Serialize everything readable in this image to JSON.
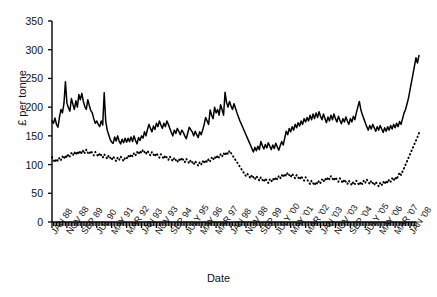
{
  "chart_data": {
    "type": "line",
    "title": "",
    "xlabel": "Date",
    "ylabel": "£ per tonne",
    "ylim": [
      0,
      350
    ],
    "ytick_values": [
      0,
      50,
      100,
      150,
      200,
      250,
      300,
      350
    ],
    "grid": false,
    "legend": null,
    "x_tick_labels": [
      "JAN 88",
      "NOV 88",
      "SEP 89",
      "JUL 90",
      "MAY 91",
      "MAR 92",
      "JAN 93",
      "NOV 93",
      "SEP 94",
      "JULY 95",
      "MAY 96",
      "MAR 97",
      "JAN 98",
      "NOV 98",
      "SEP 99",
      "JULY '00",
      "MAY '01",
      "MAR '02",
      "JAN '03",
      "NOV '03",
      "SEP '04",
      "JULY '05",
      "MAY '06",
      "MAR '07",
      "JAN '08"
    ],
    "x_index_of_labels": [
      0,
      10,
      20,
      30,
      40,
      50,
      60,
      70,
      80,
      90,
      100,
      110,
      120,
      130,
      140,
      150,
      160,
      170,
      180,
      190,
      200,
      210,
      220,
      230,
      240
    ],
    "n_points": 245,
    "series": [
      {
        "name": "solid-series",
        "style": "solid",
        "color": "#000000",
        "values": [
          176,
          172,
          181,
          170,
          165,
          182,
          196,
          190,
          206,
          244,
          207,
          199,
          193,
          215,
          205,
          196,
          211,
          200,
          222,
          213,
          224,
          210,
          201,
          196,
          213,
          203,
          194,
          190,
          180,
          172,
          176,
          170,
          166,
          176,
          169,
          225,
          176,
          160,
          152,
          144,
          139,
          137,
          148,
          141,
          150,
          141,
          136,
          144,
          138,
          146,
          139,
          146,
          140,
          148,
          140,
          150,
          142,
          136,
          147,
          142,
          150,
          146,
          157,
          150,
          161,
          170,
          163,
          157,
          167,
          161,
          172,
          166,
          176,
          169,
          163,
          172,
          166,
          176,
          170,
          163,
          156,
          150,
          160,
          154,
          163,
          158,
          152,
          160,
          156,
          150,
          145,
          155,
          165,
          161,
          157,
          150,
          158,
          152,
          147,
          157,
          152,
          160,
          170,
          182,
          176,
          170,
          195,
          186,
          180,
          200,
          190,
          196,
          186,
          204,
          196,
          186,
          226,
          208,
          200,
          210,
          202,
          196,
          206,
          198,
          190,
          183,
          176,
          170,
          164,
          158,
          152,
          146,
          140,
          134,
          128,
          122,
          130,
          124,
          132,
          126,
          140,
          133,
          127,
          135,
          129,
          138,
          132,
          126,
          134,
          128,
          137,
          131,
          125,
          133,
          140,
          134,
          146,
          158,
          152,
          163,
          157,
          166,
          160,
          170,
          164,
          173,
          167,
          176,
          170,
          180,
          174,
          182,
          176,
          186,
          178,
          188,
          180,
          190,
          182,
          192,
          184,
          178,
          188,
          180,
          173,
          183,
          176,
          186,
          178,
          188,
          180,
          174,
          184,
          177,
          171,
          180,
          174,
          183,
          176,
          170,
          180,
          174,
          184,
          178,
          190,
          200,
          210,
          196,
          187,
          180,
          173,
          166,
          160,
          168,
          162,
          170,
          164,
          158,
          166,
          160,
          168,
          162,
          156,
          164,
          158,
          166,
          160,
          168,
          162,
          170,
          164,
          172,
          166,
          175,
          170,
          180,
          190,
          196,
          206,
          216,
          230,
          244,
          258,
          272,
          286,
          277,
          290
        ]
      },
      {
        "name": "dotted-series",
        "style": "dotted",
        "color": "#000000",
        "values": [
          113,
          108,
          104,
          110,
          106,
          112,
          108,
          114,
          110,
          116,
          112,
          118,
          114,
          120,
          116,
          122,
          117,
          123,
          118,
          124,
          119,
          125,
          120,
          126,
          121,
          118,
          124,
          120,
          116,
          122,
          118,
          114,
          120,
          116,
          112,
          118,
          114,
          110,
          116,
          112,
          108,
          114,
          110,
          106,
          112,
          108,
          114,
          110,
          106,
          112,
          110,
          116,
          112,
          118,
          114,
          120,
          116,
          122,
          118,
          124,
          120,
          126,
          122,
          118,
          124,
          120,
          116,
          122,
          118,
          114,
          120,
          116,
          112,
          118,
          114,
          110,
          116,
          112,
          108,
          114,
          110,
          106,
          112,
          108,
          104,
          110,
          106,
          112,
          108,
          104,
          110,
          106,
          102,
          108,
          104,
          100,
          106,
          102,
          98,
          104,
          100,
          106,
          102,
          108,
          104,
          110,
          106,
          112,
          108,
          114,
          110,
          116,
          112,
          118,
          114,
          120,
          116,
          122,
          118,
          124,
          120,
          116,
          112,
          108,
          104,
          100,
          96,
          92,
          88,
          84,
          80,
          84,
          80,
          76,
          82,
          78,
          74,
          80,
          76,
          72,
          78,
          74,
          70,
          76,
          72,
          68,
          74,
          70,
          76,
          72,
          78,
          74,
          80,
          76,
          82,
          78,
          84,
          80,
          86,
          82,
          78,
          84,
          80,
          76,
          82,
          78,
          74,
          80,
          76,
          72,
          78,
          74,
          70,
          66,
          72,
          68,
          64,
          70,
          66,
          72,
          68,
          74,
          70,
          76,
          72,
          78,
          74,
          80,
          76,
          72,
          78,
          74,
          70,
          76,
          72,
          68,
          74,
          70,
          66,
          72,
          68,
          64,
          70,
          66,
          72,
          68,
          64,
          70,
          66,
          72,
          68,
          74,
          70,
          66,
          72,
          68,
          64,
          70,
          66,
          62,
          68,
          64,
          70,
          66,
          72,
          68,
          74,
          70,
          76,
          72,
          78,
          74,
          80,
          86,
          82,
          88,
          94,
          100,
          106,
          112,
          118,
          124,
          130,
          136,
          142,
          148,
          155
        ]
      }
    ]
  }
}
